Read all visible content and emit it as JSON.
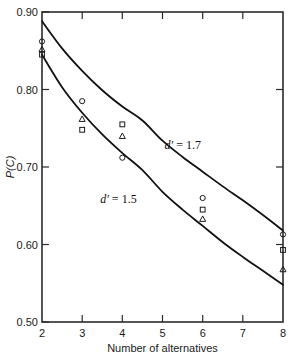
{
  "chart_data": {
    "type": "scatter",
    "title": "",
    "subtitle": "",
    "xlabel": "Number of alternatives",
    "ylabel": "P(C)",
    "xlim": [
      2,
      8
    ],
    "ylim": [
      0.5,
      0.9
    ],
    "grid": false,
    "legend_position": "none",
    "xticks": [
      2,
      3,
      4,
      5,
      6,
      7,
      8
    ],
    "xtick_labels": [
      "2",
      "3",
      "4",
      "5",
      "6",
      "7",
      "8"
    ],
    "yticks": [
      0.5,
      0.6,
      0.7,
      0.8,
      0.9
    ],
    "ytick_labels": [
      "0.50",
      "0.60",
      "0.70",
      "0.80",
      "0.90"
    ],
    "series": [
      {
        "name": "circle-observer",
        "marker": "circle",
        "x": [
          2,
          3,
          4,
          6,
          8
        ],
        "values": [
          0.862,
          0.785,
          0.712,
          0.66,
          0.613
        ]
      },
      {
        "name": "square-observer",
        "marker": "square",
        "x": [
          2,
          3,
          4,
          6,
          8
        ],
        "values": [
          0.845,
          0.748,
          0.755,
          0.645,
          0.593
        ]
      },
      {
        "name": "triangle-observer",
        "marker": "triangle",
        "x": [
          2,
          3,
          4,
          6,
          8
        ],
        "values": [
          0.852,
          0.762,
          0.74,
          0.633,
          0.568
        ]
      }
    ],
    "curves": [
      {
        "name": "d-prime-1.7",
        "label": "d' = 1.7",
        "label_symbol": "d",
        "label_prime": "′",
        "label_equals": "= 1.7",
        "x": [
          2,
          2.5,
          3,
          3.5,
          4,
          4.5,
          5,
          5.5,
          6,
          6.5,
          7,
          7.5,
          8
        ],
        "values": [
          0.888,
          0.853,
          0.824,
          0.799,
          0.778,
          0.76,
          0.734,
          0.713,
          0.694,
          0.675,
          0.657,
          0.638,
          0.618
        ]
      },
      {
        "name": "d-prime-1.5",
        "label": "d' = 1.5",
        "label_symbol": "d",
        "label_prime": "′",
        "label_equals": "= 1.5",
        "x": [
          2,
          2.5,
          3,
          3.5,
          4,
          4.5,
          5,
          5.5,
          6,
          6.5,
          7,
          7.5,
          8
        ],
        "values": [
          0.845,
          0.803,
          0.77,
          0.742,
          0.718,
          0.696,
          0.668,
          0.645,
          0.624,
          0.603,
          0.584,
          0.566,
          0.548
        ]
      }
    ],
    "annotations": [
      {
        "name": "d-prime-1.7-label",
        "text": "d′ = 1.7",
        "x": 5.05,
        "y": 0.723
      },
      {
        "name": "d-prime-1.5-label",
        "text": "d′ = 1.5",
        "x": 3.45,
        "y": 0.654
      }
    ],
    "colors": {
      "axis": "#2b2b2b",
      "curve": "#111111",
      "marker": "#1a1a1a",
      "background": "#ffffff"
    }
  }
}
